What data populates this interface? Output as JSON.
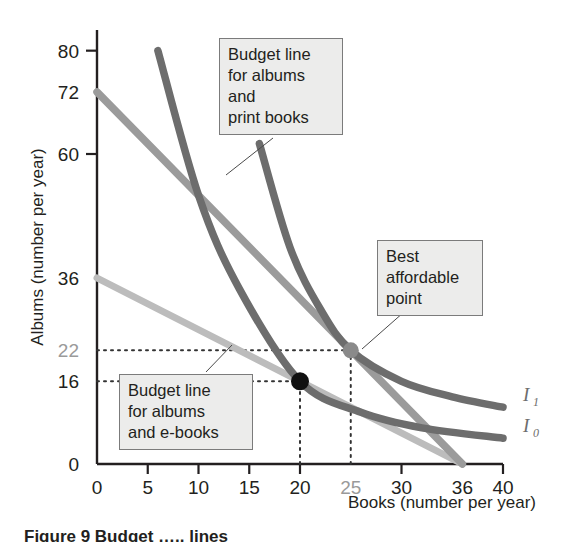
{
  "figure": {
    "caption": "Figure 9 Budget   ….. lines"
  },
  "chart_data": {
    "type": "line",
    "title": "",
    "xlabel": "Books (number per year)",
    "ylabel": "Albums (number per year)",
    "xlim": [
      0,
      40
    ],
    "ylim": [
      0,
      84
    ],
    "grid": false,
    "legend": "inline-labels",
    "xticks": [
      {
        "value": 0,
        "label": "0",
        "muted": false,
        "tick": true
      },
      {
        "value": 5,
        "label": "5",
        "muted": false,
        "tick": true
      },
      {
        "value": 10,
        "label": "10",
        "muted": false,
        "tick": true
      },
      {
        "value": 15,
        "label": "15",
        "muted": false,
        "tick": true
      },
      {
        "value": 20,
        "label": "20",
        "muted": false,
        "tick": true
      },
      {
        "value": 25,
        "label": "25",
        "muted": true,
        "tick": false
      },
      {
        "value": 30,
        "label": "30",
        "muted": false,
        "tick": true
      },
      {
        "value": 36,
        "label": "36",
        "muted": false,
        "tick": false
      },
      {
        "value": 40,
        "label": "40",
        "muted": false,
        "tick": true
      }
    ],
    "yticks": [
      {
        "value": 80,
        "label": "80",
        "muted": false,
        "tick": true
      },
      {
        "value": 72,
        "label": "72",
        "muted": false,
        "tick": false
      },
      {
        "value": 60,
        "label": "60",
        "muted": false,
        "tick": true
      },
      {
        "value": 36,
        "label": "36",
        "muted": false,
        "tick": false
      },
      {
        "value": 22,
        "label": "22",
        "muted": true,
        "tick": false
      },
      {
        "value": 16,
        "label": "16",
        "muted": false,
        "tick": false
      },
      {
        "value": 0,
        "label": "0",
        "muted": false,
        "tick": false
      }
    ],
    "series": [
      {
        "name": "Budget line for albums and e-books",
        "kind": "budget-line",
        "color": "#bcbcbc",
        "points": [
          [
            0,
            36
          ],
          [
            36,
            0
          ]
        ]
      },
      {
        "name": "Budget line for albums and print books",
        "kind": "budget-line",
        "color": "#9b9b9b",
        "points": [
          [
            0,
            72
          ],
          [
            36,
            0
          ]
        ]
      },
      {
        "name": "I0",
        "kind": "indifference-curve",
        "label": "I",
        "subscript": "0",
        "color": "#6d6d6d",
        "points": [
          [
            6,
            80
          ],
          [
            10,
            52
          ],
          [
            14,
            34
          ],
          [
            20,
            16
          ],
          [
            26,
            10
          ],
          [
            32,
            7
          ],
          [
            40,
            5
          ]
        ]
      },
      {
        "name": "I1",
        "kind": "indifference-curve",
        "label": "I",
        "subscript": "1",
        "color": "#6d6d6d",
        "points": [
          [
            16,
            62
          ],
          [
            19,
            42
          ],
          [
            22,
            30
          ],
          [
            25,
            22
          ],
          [
            30,
            16
          ],
          [
            35,
            13
          ],
          [
            40,
            11
          ]
        ]
      }
    ],
    "markers": [
      {
        "name": "best-affordable-point-ebooks",
        "x": 20,
        "y": 16,
        "color": "#111111",
        "radius": 9
      },
      {
        "name": "best-affordable-point-print",
        "x": 25,
        "y": 22,
        "color": "#8a8a8a",
        "radius": 8
      }
    ],
    "guide_lines": [
      {
        "name": "guide-16-horizontal",
        "from": [
          0,
          16
        ],
        "to": [
          20,
          16
        ]
      },
      {
        "name": "guide-20-vertical",
        "from": [
          20,
          0
        ],
        "to": [
          20,
          16
        ]
      },
      {
        "name": "guide-22-horizontal",
        "from": [
          0,
          22
        ],
        "to": [
          25,
          22
        ]
      },
      {
        "name": "guide-25-vertical",
        "from": [
          25,
          0
        ],
        "to": [
          25,
          22
        ]
      }
    ],
    "annotations": [
      {
        "name": "budget-line-print-books",
        "text": "Budget line\nfor albums and\nprint books"
      },
      {
        "name": "best-affordable-point",
        "text": "Best\naffordable\npoint"
      },
      {
        "name": "budget-line-ebooks",
        "text": "Budget line\nfor albums\nand e-books"
      }
    ]
  }
}
